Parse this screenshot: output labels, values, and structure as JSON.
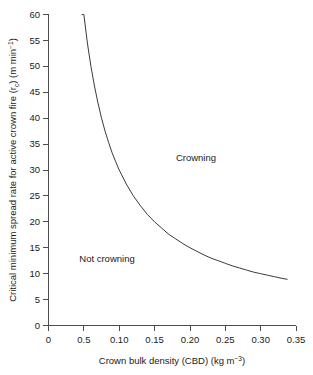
{
  "chart_data": {
    "type": "line",
    "title": "",
    "xlabel": "Crown bulk density (CBD) (kg m−3)",
    "xlabel_main": "Crown bulk density (CBD) (kg m",
    "xlabel_sup": "−3",
    "xlabel_tail": ")",
    "ylabel": "Critical minimum spread rate for active crown fire (r_c) (m min−1)",
    "ylabel_part1": "Critical minimum spread rate for active crown fire (r",
    "ylabel_sub": "c",
    "ylabel_part2": ") (m min",
    "ylabel_sup": "−1",
    "ylabel_part3": ")",
    "xlim": [
      0,
      0.35
    ],
    "ylim": [
      0,
      60
    ],
    "grid": false,
    "legend": "none",
    "xticks": [
      0,
      0.05,
      0.1,
      0.15,
      0.2,
      0.25,
      0.3,
      0.35
    ],
    "xtick_labels": [
      "0",
      "0.5",
      "0.10",
      "0.15",
      "0.20",
      "0.25",
      "0.30",
      "0.35"
    ],
    "yticks": [
      0,
      5,
      10,
      15,
      20,
      25,
      30,
      35,
      40,
      45,
      50,
      55,
      60
    ],
    "ytick_labels": [
      "0",
      "5",
      "10",
      "15",
      "20",
      "25",
      "30",
      "35",
      "40",
      "45",
      "50",
      "55",
      "60"
    ],
    "relation": "r_c = 3.0 / CBD",
    "series": [
      {
        "name": "Critical minimum spread rate threshold",
        "x": [
          0.047,
          0.05,
          0.055,
          0.06,
          0.065,
          0.07,
          0.075,
          0.08,
          0.085,
          0.09,
          0.095,
          0.1,
          0.11,
          0.12,
          0.13,
          0.14,
          0.15,
          0.16,
          0.17,
          0.18,
          0.19,
          0.2,
          0.21,
          0.22,
          0.23,
          0.24,
          0.25,
          0.26,
          0.27,
          0.28,
          0.29,
          0.3,
          0.31,
          0.32,
          0.33,
          0.338
        ],
        "y": [
          60.0,
          60.0,
          54.5,
          50.0,
          46.2,
          42.9,
          40.0,
          37.5,
          35.3,
          33.3,
          31.6,
          30.0,
          27.3,
          25.0,
          23.1,
          21.4,
          20.0,
          18.8,
          17.6,
          16.7,
          15.8,
          15.0,
          14.3,
          13.6,
          13.0,
          12.5,
          12.0,
          11.5,
          11.1,
          10.7,
          10.3,
          10.0,
          9.7,
          9.4,
          9.1,
          8.9
        ]
      }
    ],
    "annotations": [
      {
        "text": "Crowning",
        "x": 0.2,
        "y": 33
      },
      {
        "text": "Not crowning",
        "x": 0.095,
        "y": 12.5
      }
    ],
    "colors": {
      "curve": "#3a3a3a",
      "axis": "#4d4d4d",
      "text": "#1a1a1a",
      "background": "#ffffff"
    }
  }
}
